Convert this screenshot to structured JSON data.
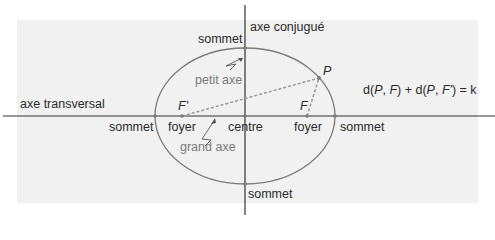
{
  "diagram": {
    "colors": {
      "background": "#ffffff",
      "panel": "#f1f1f1",
      "axes": "#333333",
      "ellipse": "#7a7a7a",
      "dashed": "#9a9a9a",
      "label_dark": "#2a2a2a",
      "label_gray": "#7a7a7a"
    },
    "axes": {
      "transverse_label": "axe transversal",
      "conjugate_label": "axe conjugué"
    },
    "vertices": {
      "top": "sommet",
      "bottom": "sommet",
      "left": "sommet",
      "right": "sommet"
    },
    "foci": {
      "left_symbol": "F'",
      "right_symbol": "F",
      "left_label": "foyer",
      "right_label": "foyer"
    },
    "center_label": "centre",
    "point_label": "P",
    "minor_axis_label": "petit axe",
    "major_axis_label": "grand axe",
    "formula": {
      "d1": "d(",
      "p1": "P",
      "sep1": ", ",
      "f1": "F",
      "mid": ") + d(",
      "p2": "P",
      "sep2": ", ",
      "f2": "F'",
      "end": ") = k"
    }
  }
}
